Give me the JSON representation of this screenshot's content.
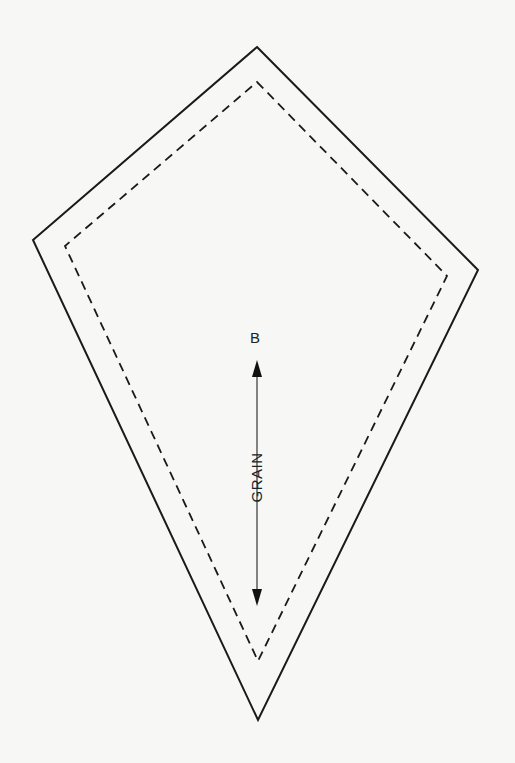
{
  "diagram": {
    "type": "sewing-pattern-piece",
    "shape": "kite",
    "piece_label": "B",
    "grain_label": "GRAIN",
    "colors": {
      "background": "#f7f7f5",
      "line": "#1a1a1a",
      "arrow": "#333333"
    },
    "outer_cut_line": {
      "style": "solid",
      "points": [
        [
          257,
          47
        ],
        [
          478,
          270
        ],
        [
          258,
          720
        ],
        [
          33,
          240
        ]
      ]
    },
    "inner_seam_line": {
      "style": "dashed",
      "points": [
        [
          257,
          82
        ],
        [
          447,
          276
        ],
        [
          258,
          661
        ],
        [
          65,
          246
        ]
      ]
    },
    "grain_arrow": {
      "x": 257,
      "y_top": 361,
      "y_bottom": 605,
      "direction": "double"
    }
  }
}
